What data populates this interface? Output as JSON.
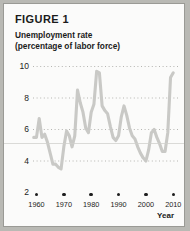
{
  "figure": {
    "label": "FIGURE 1",
    "subtitle_line1": "Unemployment rate",
    "subtitle_line2": "(percentage of labor force)",
    "year_axis_label": "Year"
  },
  "colors": {
    "line": "#c9c9c6",
    "grid": "#b5b5b1",
    "text": "#1b1b1b",
    "background": "#fbfbfa",
    "border": "#9a9a95",
    "dot": "#1d1d1d"
  },
  "chart_data": {
    "type": "line",
    "title": "Unemployment rate",
    "subtitle": "(percentage of labor force)",
    "xlabel": "Year",
    "ylabel": "",
    "xlim": [
      1958,
      2011
    ],
    "ylim": [
      2,
      10
    ],
    "yticks": [
      2,
      4,
      6,
      8,
      10
    ],
    "xticks": [
      1960,
      1970,
      1980,
      1990,
      2000,
      2010
    ],
    "grid": "horizontal-dotted",
    "legend": "none",
    "series": [
      {
        "name": "Unemployment rate",
        "x": [
          1959,
          1960,
          1961,
          1962,
          1963,
          1964,
          1965,
          1966,
          1967,
          1968,
          1969,
          1970,
          1971,
          1972,
          1973,
          1974,
          1975,
          1976,
          1977,
          1978,
          1979,
          1980,
          1981,
          1982,
          1983,
          1984,
          1985,
          1986,
          1987,
          1988,
          1989,
          1990,
          1991,
          1992,
          1993,
          1994,
          1995,
          1996,
          1997,
          1998,
          1999,
          2000,
          2001,
          2002,
          2003,
          2004,
          2005,
          2006,
          2007,
          2008,
          2009,
          2010
        ],
        "values": [
          5.5,
          5.5,
          6.7,
          5.5,
          5.7,
          5.2,
          4.5,
          3.8,
          3.8,
          3.6,
          3.5,
          4.9,
          5.9,
          5.6,
          4.9,
          5.6,
          8.5,
          7.7,
          7.1,
          6.1,
          5.8,
          7.1,
          7.6,
          9.7,
          9.6,
          7.5,
          7.2,
          7.0,
          6.2,
          5.5,
          5.3,
          5.6,
          6.8,
          7.5,
          6.9,
          6.1,
          5.6,
          5.4,
          4.9,
          4.5,
          4.2,
          4.0,
          4.7,
          5.8,
          6.0,
          5.5,
          5.1,
          4.6,
          4.6,
          5.8,
          9.3,
          9.6
        ]
      }
    ],
    "annotations": [
      {
        "text": "FIGURE 1",
        "position": "top-left"
      }
    ]
  },
  "axis": {
    "y_ticks": [
      {
        "value": "10"
      },
      {
        "value": "8"
      },
      {
        "value": "6"
      },
      {
        "value": "4"
      },
      {
        "value": "2"
      }
    ],
    "x_ticks": [
      {
        "value": "1960"
      },
      {
        "value": "1970"
      },
      {
        "value": "1980"
      },
      {
        "value": "1990"
      },
      {
        "value": "2000"
      },
      {
        "value": "2010"
      }
    ]
  }
}
